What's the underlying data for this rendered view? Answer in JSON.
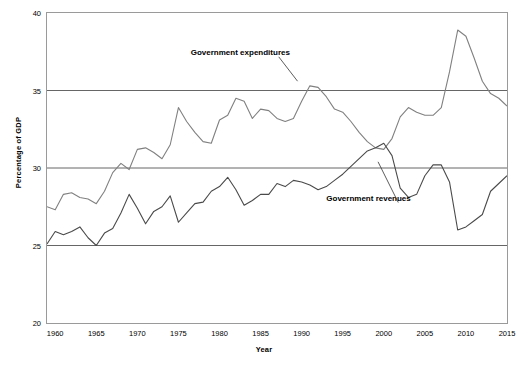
{
  "chart_data": {
    "type": "line",
    "title": "",
    "xlabel": "Year",
    "ylabel": "Percentage of GDP",
    "xlim": [
      1959,
      2015
    ],
    "ylim": [
      20,
      40
    ],
    "xticks": [
      1960,
      1965,
      1970,
      1975,
      1980,
      1985,
      1990,
      1995,
      2000,
      2005,
      2010,
      2015
    ],
    "yticks": [
      20,
      25,
      30,
      35,
      40
    ],
    "grid": true,
    "gridlines_y": [
      25,
      30,
      35
    ],
    "legend_position": "inline-annotations",
    "annotations": [
      {
        "label": "Government expenditures",
        "x": 1986,
        "y": 36.6
      },
      {
        "label": "Government revenues",
        "x": 1999.5,
        "y": 27.6
      }
    ],
    "series": [
      {
        "name": "Government expenditures",
        "color": "#808080",
        "x": [
          1959,
          1960,
          1961,
          1962,
          1963,
          1964,
          1965,
          1966,
          1967,
          1968,
          1969,
          1970,
          1971,
          1972,
          1973,
          1974,
          1975,
          1976,
          1977,
          1978,
          1979,
          1980,
          1981,
          1982,
          1983,
          1984,
          1985,
          1986,
          1987,
          1988,
          1989,
          1990,
          1991,
          1992,
          1993,
          1994,
          1995,
          1996,
          1997,
          1998,
          1999,
          2000,
          2001,
          2002,
          2003,
          2004,
          2005,
          2006,
          2007,
          2008,
          2009,
          2010,
          2011,
          2012,
          2013,
          2014,
          2015
        ],
        "values": [
          27.5,
          27.3,
          28.3,
          28.4,
          28.1,
          28.0,
          27.7,
          28.5,
          29.7,
          30.3,
          29.9,
          31.2,
          31.3,
          31.0,
          30.6,
          31.5,
          33.9,
          33.0,
          32.3,
          31.7,
          31.6,
          33.1,
          33.4,
          34.5,
          34.3,
          33.2,
          33.8,
          33.7,
          33.2,
          33.0,
          33.2,
          34.3,
          35.3,
          35.2,
          34.6,
          33.8,
          33.6,
          33.0,
          32.3,
          31.7,
          31.3,
          31.2,
          31.9,
          33.3,
          33.9,
          33.6,
          33.4,
          33.4,
          33.9,
          36.2,
          38.9,
          38.5,
          37.1,
          35.6,
          34.8,
          34.5,
          34.0
        ]
      },
      {
        "name": "Government revenues",
        "color": "#4a4a4a",
        "x": [
          1959,
          1960,
          1961,
          1962,
          1963,
          1964,
          1965,
          1966,
          1967,
          1968,
          1969,
          1970,
          1971,
          1972,
          1973,
          1974,
          1975,
          1976,
          1977,
          1978,
          1979,
          1980,
          1981,
          1982,
          1983,
          1984,
          1985,
          1986,
          1987,
          1988,
          1989,
          1990,
          1991,
          1992,
          1993,
          1994,
          1995,
          1996,
          1997,
          1998,
          1999,
          2000,
          2001,
          2002,
          2003,
          2004,
          2005,
          2006,
          2007,
          2008,
          2009,
          2010,
          2011,
          2012,
          2013,
          2014,
          2015
        ],
        "values": [
          25.1,
          25.9,
          25.7,
          25.9,
          26.2,
          25.5,
          25.0,
          25.8,
          26.1,
          27.1,
          28.3,
          27.4,
          26.4,
          27.2,
          27.5,
          28.2,
          26.5,
          27.1,
          27.7,
          27.8,
          28.5,
          28.8,
          29.4,
          28.6,
          27.6,
          27.9,
          28.3,
          28.3,
          29.0,
          28.8,
          29.2,
          29.1,
          28.9,
          28.6,
          28.8,
          29.2,
          29.6,
          30.1,
          30.6,
          31.1,
          31.3,
          31.6,
          30.8,
          28.7,
          28.1,
          28.3,
          29.5,
          30.2,
          30.2,
          29.1,
          26.0,
          26.2,
          26.6,
          27.0,
          28.5,
          29.0,
          29.5
        ]
      }
    ]
  },
  "axis": {
    "ylabel": "Percentage of GDP",
    "xlabel": "Year",
    "yticks": [
      "20",
      "25",
      "30",
      "35",
      "40"
    ],
    "xticks": [
      "1960",
      "1965",
      "1970",
      "1975",
      "1980",
      "1985",
      "1990",
      "1995",
      "2000",
      "2005",
      "2010",
      "2015"
    ]
  },
  "annotation_labels": {
    "expenditures": "Government expenditures",
    "revenues": "Government revenues"
  }
}
